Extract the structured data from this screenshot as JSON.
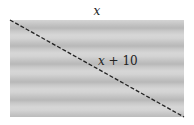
{
  "diagram": {
    "top_label": "x",
    "diagonal_label_var": "x",
    "diagonal_label_rest": " + 10",
    "shape": "rectangle with dashed diagonal"
  }
}
